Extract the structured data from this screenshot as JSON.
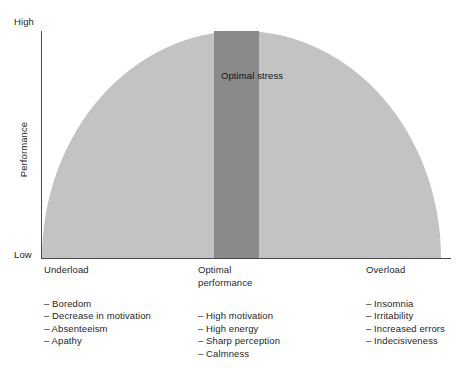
{
  "chart_data": {
    "type": "area",
    "title": "",
    "xlabel": "",
    "ylabel": "Performance",
    "y_axis": {
      "low_label": "Low",
      "high_label": "High"
    },
    "x_categories": [
      "Underload",
      "Optimal performance",
      "Overload"
    ],
    "annotation": "Optimal stress",
    "curve": {
      "shape": "inverted-u",
      "x": [
        0,
        0.125,
        0.25,
        0.375,
        0.5,
        0.625,
        0.75,
        0.875,
        1.0
      ],
      "y": [
        0.0,
        0.61,
        0.87,
        0.98,
        1.0,
        0.98,
        0.87,
        0.61,
        0.0
      ]
    },
    "bands": [
      {
        "name": "suboptimal",
        "x_from": 0.0,
        "x_to": 0.43,
        "color": "#c3c3c3"
      },
      {
        "name": "optimal stress",
        "x_from": 0.43,
        "x_to": 0.545,
        "color": "#8a8a8a"
      },
      {
        "name": "suboptimal",
        "x_from": 0.545,
        "x_to": 1.0,
        "color": "#c3c3c3"
      }
    ],
    "grid": false,
    "legend": "none"
  },
  "axes": {
    "y_high": "High",
    "y_low": "Low",
    "y_title": "Performance"
  },
  "plot": {
    "optimal_stress_label": "Optimal\nstress",
    "colors": {
      "curve_fill": "#c3c3c3",
      "optimal_band": "#8a8a8a",
      "axis": "#4a4a4a",
      "text": "#1f1f1f",
      "background": "#ffffff"
    }
  },
  "columns": [
    {
      "heading": "Underload",
      "items": [
        "– Boredom",
        "– Decrease in motivation",
        "– Absenteeism",
        "– Apathy"
      ]
    },
    {
      "heading": "Optimal\nperformance",
      "items": [
        "– High motivation",
        "– High energy",
        "– Sharp perception",
        "– Calmness"
      ]
    },
    {
      "heading": "Overload",
      "items": [
        "– Insomnia",
        "– Irritability",
        "– Increased errors",
        "– Indecisiveness"
      ]
    }
  ]
}
